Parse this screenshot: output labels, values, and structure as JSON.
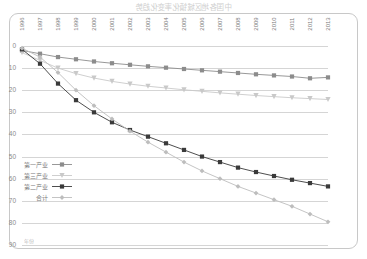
{
  "title": "中国各地区城镇化率变化趋势",
  "axis_note": "年份",
  "chart_data": {
    "type": "line",
    "title": "中国各地区城镇化率变化趋势",
    "xlabel": "",
    "ylabel": "",
    "grid": true,
    "legend_position": "bottom-right",
    "x_axis_direction": "right-to-left",
    "y_axis_position": "right",
    "xlim": [
      1996,
      2013
    ],
    "ylim": [
      0,
      90
    ],
    "ytick_values": [
      0,
      10,
      20,
      30,
      40,
      50,
      60,
      70,
      80,
      90
    ],
    "categories": [
      1996,
      1997,
      1998,
      1999,
      2000,
      2001,
      2002,
      2003,
      2004,
      2005,
      2006,
      2007,
      2008,
      2009,
      2010,
      2011,
      2012,
      2013
    ],
    "series": [
      {
        "name": "第一产业",
        "marker": "square",
        "color": "#8c8c8c",
        "values": [
          2.0,
          3.5,
          5.0,
          6.0,
          7.0,
          7.8,
          8.5,
          9.2,
          9.8,
          10.4,
          11.0,
          11.6,
          12.2,
          12.8,
          13.3,
          13.8,
          14.6,
          14.2
        ]
      },
      {
        "name": "第三产业",
        "marker": "triangle",
        "color": "#c9c9c9",
        "values": [
          3.0,
          6.5,
          10.0,
          12.5,
          14.5,
          16.0,
          17.2,
          18.2,
          19.0,
          19.8,
          20.5,
          21.2,
          21.8,
          22.4,
          22.9,
          23.4,
          23.8,
          24.2
        ]
      },
      {
        "name": "第二产业",
        "marker": "square",
        "color": "#3a3a3a",
        "values": [
          1.5,
          8.0,
          17.0,
          24.5,
          30.0,
          34.5,
          38.0,
          41.0,
          44.0,
          47.0,
          50.0,
          52.5,
          55.0,
          57.0,
          58.8,
          60.5,
          62.0,
          63.5
        ]
      },
      {
        "name": "合计",
        "marker": "diamond",
        "color": "#bdbdbd",
        "values": [
          1.0,
          5.0,
          12.0,
          20.0,
          27.0,
          33.0,
          38.5,
          43.5,
          48.0,
          52.5,
          56.5,
          60.0,
          63.5,
          66.5,
          69.5,
          72.5,
          76.0,
          79.5
        ]
      }
    ]
  },
  "legend": {
    "items": [
      {
        "label": "第一产业",
        "marker": "square",
        "color": "#8c8c8c"
      },
      {
        "label": "第三产业",
        "marker": "triangle",
        "color": "#c9c9c9"
      },
      {
        "label": "第二产业",
        "marker": "square",
        "color": "#3a3a3a"
      },
      {
        "label": "合计",
        "marker": "diamond",
        "color": "#bdbdbd"
      }
    ]
  }
}
